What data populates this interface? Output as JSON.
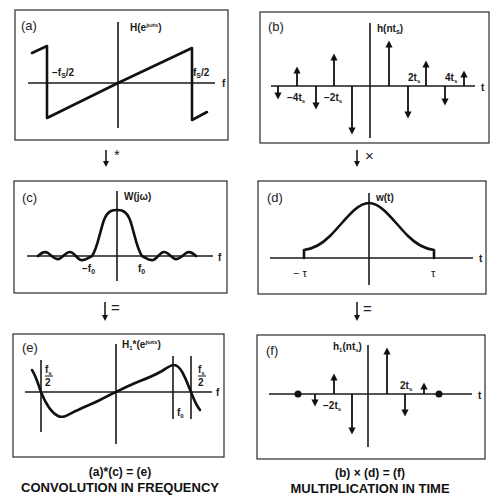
{
  "panels": {
    "a": {
      "tag": "(a)",
      "title": "H(e^{jωt_s})",
      "title_text": "H(e",
      "title_sup": "jωts",
      "title_close": ")",
      "left_label": "−f",
      "left_sub": "S",
      "left_tail": "/2",
      "right_label": "f",
      "right_sub": "S",
      "right_tail": "/2",
      "axis_label": "f"
    },
    "b": {
      "tag": "(b)",
      "title_text": "h(nt",
      "title_sub": "s",
      "title_close": ")",
      "axis_label": "t",
      "tick_labels": [
        {
          "text": "−4t",
          "sub": "s"
        },
        {
          "text": "−2t",
          "sub": "s"
        },
        {
          "text": "2t",
          "sub": "s"
        },
        {
          "text": "4t",
          "sub": "s"
        }
      ]
    },
    "c": {
      "tag": "(c)",
      "title": "W(jω)",
      "axis_label": "f",
      "neg_label": "−f",
      "neg_sub": "0",
      "pos_label": "f",
      "pos_sub": "0"
    },
    "d": {
      "tag": "(d)",
      "title": "w(t)",
      "axis_label": "t",
      "neg_label": "− τ",
      "pos_label": "τ"
    },
    "e": {
      "tag": "(e)",
      "title_text": "H",
      "title_sub": "1",
      "title_mid": "*(e",
      "title_sup": "jωts",
      "title_close": ")",
      "axis_label": "f",
      "left_frac_num": "f",
      "left_frac_sub": "s",
      "left_frac_den": "2",
      "right_frac_num": "f",
      "right_frac_sub": "s",
      "right_frac_den": "2",
      "f0_label": "f",
      "f0_sub": "0"
    },
    "f": {
      "tag": "(f)",
      "title_text": "h",
      "title_sub": "1",
      "title_mid": "(nt",
      "title_sub2": "s",
      "title_close": ")",
      "axis_label": "t",
      "tick_labels": [
        {
          "text": "−2t",
          "sub": "s"
        },
        {
          "text": "2t",
          "sub": "s"
        }
      ]
    }
  },
  "operators": {
    "left_top": "*",
    "right_top": "×",
    "left_bottom": "=",
    "right_bottom": "="
  },
  "captions": {
    "left": {
      "equation": "(a)*(c) = (e)",
      "title": "CONVOLUTION IN FREQUENCY"
    },
    "right": {
      "equation": "(b) × (d) = (f)",
      "title": "MULTIPLICATION IN TIME"
    }
  },
  "colors": {
    "ink": "#111111",
    "background": "#ffffff"
  }
}
